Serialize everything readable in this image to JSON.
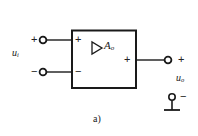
{
  "figure": {
    "caption": "a)",
    "kind": "amplifier-block-diagram",
    "colors": {
      "line": "#1a1a1a",
      "background": "#ffffff",
      "text": "#1a1a1a"
    }
  },
  "block": {
    "gain_label": "A",
    "gain_subscript": "o",
    "triangle_icon": "amplifier-triangle-icon",
    "terminal_plus_label": "+",
    "terminal_minus_label": "−",
    "output_plus_label": "+"
  },
  "input": {
    "variable": "u",
    "subscript": "i",
    "plus_label": "+",
    "minus_label": "−"
  },
  "output": {
    "variable": "u",
    "subscript": "o",
    "plus_label": "+",
    "minus_label": "−"
  },
  "ground": {
    "icon": "ground-icon",
    "sign_label": "−"
  }
}
